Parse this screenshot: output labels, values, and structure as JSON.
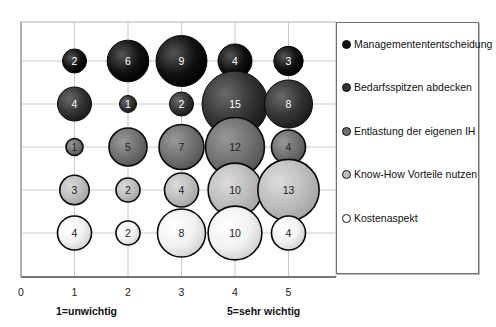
{
  "chart_data": {
    "type": "bubble",
    "title": "",
    "xlabel": "",
    "ylabel": "",
    "x_ticks": [
      "0",
      "1",
      "2",
      "3",
      "4",
      "5"
    ],
    "x_annotations": {
      "low": "1=unwichtig",
      "high": "5=sehr wichtig"
    },
    "xlim": [
      0,
      6
    ],
    "grid": true,
    "legend_position": "right",
    "categories": [
      1,
      2,
      3,
      4,
      5
    ],
    "series": [
      {
        "name": "Managementententscheidung",
        "color": "#111111",
        "values": [
          2,
          6,
          9,
          4,
          3
        ]
      },
      {
        "name": "Bedarfsspitzen abdecken",
        "color": "#2e2e2e",
        "values": [
          4,
          1,
          2,
          15,
          8
        ]
      },
      {
        "name": "Entlastung der eigenen IH",
        "color": "#6e6e6e",
        "values": [
          1,
          5,
          7,
          12,
          4
        ]
      },
      {
        "name": "Know-How Vorteile nutzen",
        "color": "#b8b8b8",
        "values": [
          3,
          2,
          4,
          10,
          13
        ]
      },
      {
        "name": "Kostenaspekt",
        "color": "#f4f4f4",
        "values": [
          4,
          2,
          8,
          10,
          4
        ]
      }
    ]
  },
  "legend": {
    "items": [
      {
        "label": "Managementententscheidung"
      },
      {
        "label": "Bedarfsspitzen abdecken"
      },
      {
        "label": "Entlastung der eigenen IH"
      },
      {
        "label": "Know-How Vorteile nutzen"
      },
      {
        "label": "Kostenaspekt"
      }
    ]
  },
  "axis": {
    "low_label": "1=unwichtig",
    "high_label": "5=sehr wichtig"
  }
}
